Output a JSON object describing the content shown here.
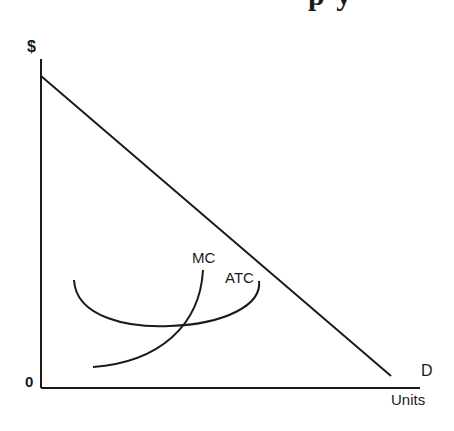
{
  "title_fragment": "p y",
  "axes": {
    "y_label": "$",
    "x_label": "Units",
    "origin_label": "0"
  },
  "curves": {
    "demand_label": "D",
    "mc_label": "MC",
    "atc_label": "ATC"
  },
  "colors": {
    "ink": "#1a1a1a",
    "background": "#ffffff"
  }
}
